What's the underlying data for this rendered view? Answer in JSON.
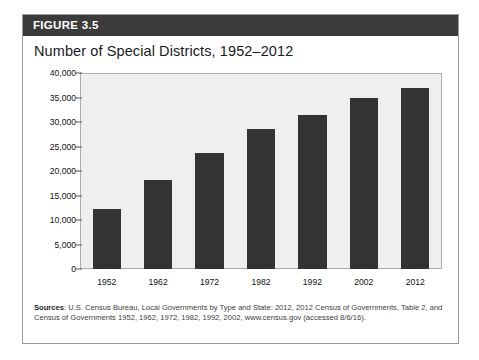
{
  "figure": {
    "banner_label": "FIGURE 3.5",
    "title": "Number of Special Districts, 1952–2012",
    "source_prefix": "Sources",
    "source_text": ": U.S. Census Bureau, Local Governments by Type and State: 2012, 2012 Census of Governments, Table 2, and Census of Governments 1952, 1962, 1972, 1982, 1992, 2002, www.census.gov (accessed 8/6/16)."
  },
  "colors": {
    "banner_background": "#3b3b3b",
    "banner_text": "#ffffff",
    "bar_fill": "#333333",
    "plot_background": "#efefef",
    "plot_border": "#adadad",
    "card_border": "#9a9a9a"
  },
  "chart_data": {
    "type": "bar",
    "title": "Number of Special Districts, 1952–2012",
    "xlabel": "",
    "ylabel": "",
    "categories": [
      "1952",
      "1962",
      "1972",
      "1982",
      "1992",
      "2002",
      "2012"
    ],
    "values": [
      12300,
      18300,
      23900,
      28700,
      31500,
      35100,
      37200
    ],
    "ylim": [
      0,
      40000
    ],
    "yticks": [
      0,
      5000,
      10000,
      15000,
      20000,
      25000,
      30000,
      35000,
      40000
    ],
    "ytick_labels": [
      "0",
      "5,000",
      "10,000",
      "15,000",
      "20,000",
      "25,000",
      "30,000",
      "35,000",
      "40,000"
    ],
    "grid": false,
    "legend": "none",
    "bar_color": "#333333"
  }
}
